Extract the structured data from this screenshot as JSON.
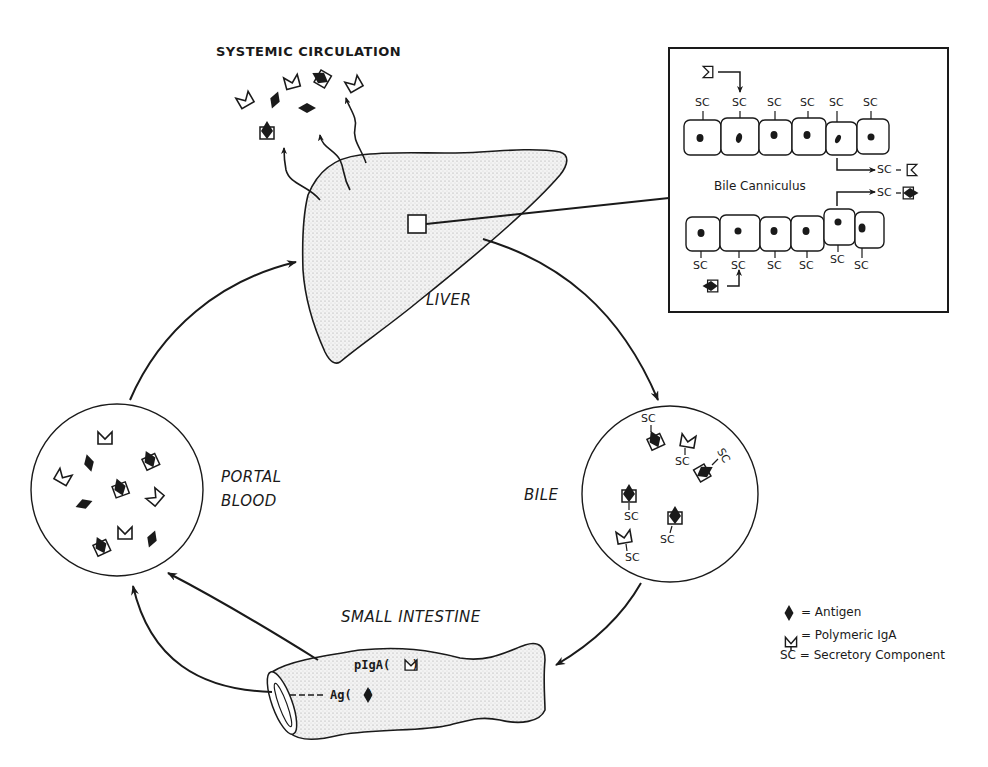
{
  "figure": {
    "title": "SYSTEMIC CIRCULATION",
    "organs": {
      "liver": "LIVER",
      "portal_blood": [
        "PORTAL",
        "BLOOD"
      ],
      "bile": "BILE",
      "small_intestine": "SMALL INTESTINE"
    },
    "intestine_labels": {
      "piga": "pIgA",
      "ag": "Ag"
    },
    "inset": {
      "label": "Bile Canniculus",
      "sc_label": "SC",
      "top_row_sc_count": 6,
      "bottom_row_sc_count": 6
    },
    "bile_circle_sc": [
      "SC",
      "SC",
      "SC",
      "SC",
      "SC",
      "SC"
    ],
    "legend": [
      {
        "symbol": "antigen-icon",
        "text": "= Antigen"
      },
      {
        "symbol": "polymeric-iga-icon",
        "text": "= Polymeric IgA"
      },
      {
        "symbol": "SC",
        "text": "= Secretory Component"
      }
    ],
    "flow": [
      {
        "from": "PORTAL BLOOD",
        "to": "LIVER"
      },
      {
        "from": "LIVER",
        "to": "BILE"
      },
      {
        "from": "BILE",
        "to": "SMALL INTESTINE"
      },
      {
        "from": "SMALL INTESTINE",
        "to": "PORTAL BLOOD"
      },
      {
        "from": "LIVER",
        "to": "SYSTEMIC CIRCULATION"
      }
    ],
    "colors": {
      "ink": "#1a1a1a",
      "stipple": "#e9e9e9",
      "background": "#ffffff"
    }
  }
}
